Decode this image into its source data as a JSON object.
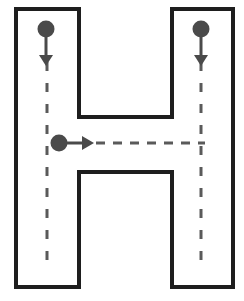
{
  "diagram": {
    "letter": "H",
    "colors": {
      "outline": "#1e1e1e",
      "stroke_path": "#5a5a5a",
      "start_dot": "#4a4a4a",
      "background": "#ffffff"
    },
    "strokes": [
      {
        "id": 1,
        "name": "left-vertical",
        "direction": "down"
      },
      {
        "id": 2,
        "name": "right-vertical",
        "direction": "down"
      },
      {
        "id": 3,
        "name": "crossbar",
        "direction": "right"
      }
    ]
  }
}
